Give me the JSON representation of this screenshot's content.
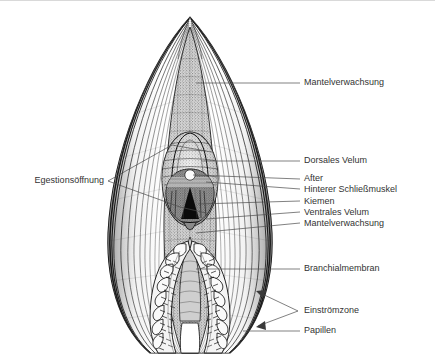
{
  "figure": {
    "background_color": "#ffffff",
    "ink_color": "#1a1a1a",
    "label_color": "#333333",
    "leader_color": "#4a4a4a",
    "border_color": "#d9d9d9"
  },
  "labels": {
    "mantelverwachsung_top": "Mantelverwachsung",
    "egestionsoeffnung": "Egestionsöffnung",
    "dorsales_velum": "Dorsales Velum",
    "after": "After",
    "hinterer_schliessmuskel": "Hinterer Schließmuskel",
    "kiemen": "Kiemen",
    "ventrales_velum": "Ventrales Velum",
    "mantelverwachsung_mid": "Mantelverwachsung",
    "branchialmembran": "Branchialmembran",
    "einstroemzone": "Einströmzone",
    "papillen": "Papillen"
  }
}
